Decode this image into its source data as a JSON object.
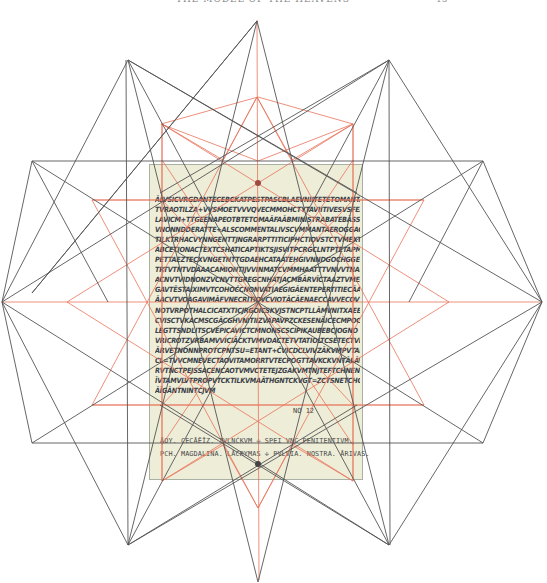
{
  "header": {
    "title": "THE MODEL OF THE HEAVENS",
    "page_number": "15"
  },
  "manuscript": {
    "lines": [
      "ĀLVSICVRGDANTECEBCKATPESTPASCBLAEVNIITETETOMANTACVRT",
      "TVRAOTILZA+VVSMOETVVVQVECMMOHCTYTAVIITIVESVSFEACEKVNT",
      "LAVICM+TTGEENAPEOTBTETOMAĀFAĀBMINISTRABATEBĀSSRVOB",
      "VNONNDDERATTE+ALSCOMMENTALIVSCVMMANTAEROGGACCCEN",
      "TILKTRHACVYNNGENTTJNGRARPTTITICIPHCTIOVSTCTVMEXTIPE",
      "ABCETIONACTEXTCSHATICAPTIKTSJISVITPCRGCLNTPTETAPMBEATM",
      "PETTAEZTECXVNGETNTTGDAEHCATAATEHGIVNNDGOCHGGECTPPAL",
      "TRTVTNTVDAAACAMIONTIJVVINMATCVMMHAATTTVNVVTNAMBYCIG",
      "ACNVTVIDNONZVCNVTTGREGCNHATJACMBĀRVĪCTAAZTVMESOIC",
      "GAVTĒSTAIXIMVTCOHOČCNONVATIAEGIGĀENTEPERTITIECĀAT",
      "ĀACVTVOAGAVIMĀFVNECRITIOVCVIOTĀCĀENAECCAVVECOVTTECA",
      "NOTVRPOTHALCICATXTICJRGOICSKVJSTNCPTLLĀMVNITXAEENS",
      "CVISCTVKACMSCGĀCGHVNITIIZVAPAVPZCKESENĀICECMPOCENA",
      "LEGTTSNDLITSCVEPICAVICTCMNONSCSCIPIKAUBEBCJOGNO",
      "VRICROTZVRBAMVVICIĀCKTVMVDACTETVTATIOLTCSETECTVPNE",
      "ĀRVETNONNPROTCPNTSU=ETANT+ČVICDCLVIVZĀKVMPVTAER",
      "CL=TVVCMNEVECTAOVITAMORRTVTECPOGTTAVKCKVNTĀLĀVTCMP",
      "RVTNCTPEJSSACENCAOTVMVCTETEJZGAKVMTNJTEFTCHNENTR",
      "ĪVTAMVLVTPROPVTCKTILKVMAĀTHGNTCKVGT=ZCTSNETCHGĀ",
      "ĀĪGĀNTNINTCJVM"
    ],
    "colophon": [
      "ĀOY. CECĀĒĪZ. TVLNĆKVM ✢ SPEI VNC PENITENTIVM.",
      "PCH. MAGDALINA. LĀCRYMAS ✢ PVLVIA. NOSTRA. ĀRIVAS."
    ],
    "note": "NO 12"
  },
  "diagram": {
    "center": [
      273,
      302
    ],
    "colors": {
      "black_lines": "#555555",
      "red_lines": "#e8735a",
      "page_bg": "#eeedd8",
      "page_border": "#a9b0a4"
    },
    "black_star_outer_points": [
      [
        271,
        20
      ],
      [
        389,
        60
      ],
      [
        482,
        302
      ],
      [
        389,
        545
      ],
      [
        271,
        582
      ],
      [
        128,
        545
      ],
      [
        2,
        302
      ],
      [
        128,
        60
      ]
    ]
  }
}
